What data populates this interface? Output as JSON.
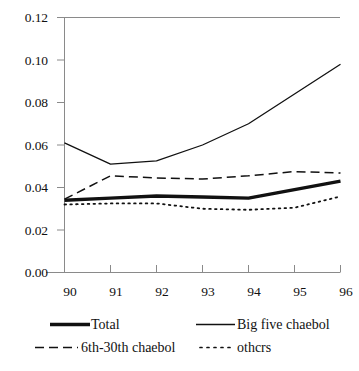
{
  "chart_data": {
    "type": "line",
    "title": "",
    "subtitle": "",
    "xlabel": "",
    "ylabel": "",
    "x": [
      "90",
      "91",
      "92",
      "93",
      "94",
      "95",
      "96"
    ],
    "xtick_labels": [
      "90",
      "91",
      "92",
      "93",
      "94",
      "95",
      "96"
    ],
    "ytick_labels": [
      "0.12",
      "0.10",
      "0.08",
      "0.06",
      "0.04",
      "0.02",
      "0.00"
    ],
    "ytick_values": [
      0.12,
      0.1,
      0.08,
      0.06,
      0.04,
      0.02,
      0.0
    ],
    "ylim": [
      0.0,
      0.12
    ],
    "xlim": [
      "90",
      "96"
    ],
    "grid": false,
    "legend_position": "bottom",
    "series": [
      {
        "name": "Total",
        "style": "thick-solid",
        "color": "#111111",
        "values": [
          0.034,
          0.035,
          0.036,
          0.0355,
          0.035,
          0.039,
          0.043
        ]
      },
      {
        "name": "Big five chaebol",
        "style": "solid",
        "color": "#111111",
        "values": [
          0.061,
          0.051,
          0.0525,
          0.06,
          0.07,
          0.084,
          0.098
        ]
      },
      {
        "name": "6th-30th chaebol",
        "style": "dashed",
        "color": "#111111",
        "values": [
          0.0345,
          0.0455,
          0.0445,
          0.044,
          0.0455,
          0.0475,
          0.0468
        ]
      },
      {
        "name": "othcrs",
        "style": "dotted",
        "color": "#111111",
        "values": [
          0.032,
          0.0325,
          0.0325,
          0.03,
          0.0295,
          0.0305,
          0.0358
        ]
      }
    ]
  },
  "axes": {
    "y_labels": [
      "0.12",
      "0.10",
      "0.08",
      "0.06",
      "0.04",
      "0.02",
      "0.00"
    ],
    "x_labels": [
      "90",
      "91",
      "92",
      "93",
      "94",
      "95",
      "96"
    ]
  },
  "legend": {
    "entries": [
      {
        "label": "Total",
        "style": "thick-solid"
      },
      {
        "label": "Big five chaebol",
        "style": "solid"
      },
      {
        "label": "6th-30th chaebol",
        "style": "dashed"
      },
      {
        "label": "othcrs",
        "style": "dotted"
      }
    ]
  }
}
